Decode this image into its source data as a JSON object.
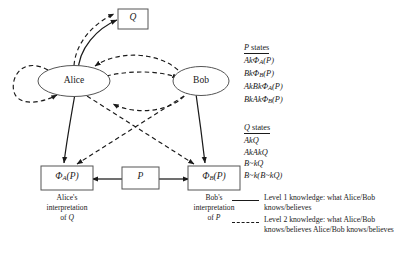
{
  "diagram": {
    "title_nodes": {
      "q_box": "Q",
      "alice_ellipse": "Alice",
      "bob_ellipse": "Bob",
      "phi_a_box": "Φ",
      "phi_a_sub": "A",
      "phi_a_arg": "(P)",
      "p_box": "P",
      "phi_b_box": "Φ",
      "phi_b_sub": "B",
      "phi_b_arg": "(P)"
    },
    "captions": {
      "alice_caption_line1": "Alice's",
      "alice_caption_line2": "interpretation",
      "alice_caption_line3_prefix": "of ",
      "alice_caption_line3_italic": "Q",
      "bob_caption_line1": "Bob's",
      "bob_caption_line2": "interpretation",
      "bob_caption_line3_prefix": "of ",
      "bob_caption_line3_italic": "P"
    },
    "colors": {
      "line": "#1a1a1a",
      "node_stroke": "#555555",
      "text": "#1a1a1a",
      "background": "#ffffff"
    }
  },
  "states": [
    {
      "heading_italic": "P",
      "heading_rest": " states",
      "items": [
        "AkΦₐ(P)",
        "BkΦᵦ(P)",
        "AkBkΦₐ(P)",
        "BkAkΦᵦ(P)"
      ],
      "items_rich": [
        {
          "pre": "AkΦ",
          "sub": "A",
          "post": "(P)"
        },
        {
          "pre": "BkΦ",
          "sub": "B",
          "post": "(P)"
        },
        {
          "pre": "AkBkΦ",
          "sub": "A",
          "post": "(P)"
        },
        {
          "pre": "BkAkΦ",
          "sub": "B",
          "post": "(P)"
        }
      ]
    },
    {
      "heading_italic": "Q",
      "heading_rest": " states",
      "items": [
        "AkQ",
        "AkAkQ",
        "B~kQ",
        "B~k(B~kQ)"
      ],
      "items_rich": [
        {
          "pre": "AkQ",
          "sub": "",
          "post": ""
        },
        {
          "pre": "AkAkQ",
          "sub": "",
          "post": ""
        },
        {
          "pre": "B~kQ",
          "sub": "",
          "post": ""
        },
        {
          "pre": "B~k(B~kQ)",
          "sub": "",
          "post": ""
        }
      ]
    }
  ],
  "legend": [
    {
      "style": "solid",
      "line1": "Level 1 knowledge: what Alice/Bob",
      "line2": "knows/believes"
    },
    {
      "style": "dashed",
      "line1": "Level 2 knowledge: what Alice/Bob",
      "line2": "knows/believes Alice/Bob knows/believes"
    }
  ]
}
